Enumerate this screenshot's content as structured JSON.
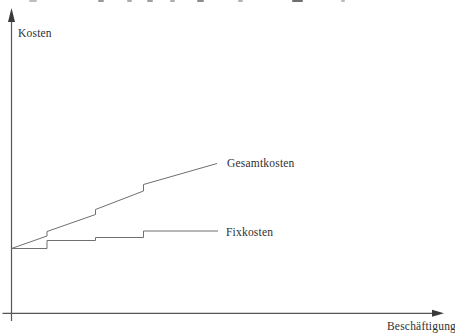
{
  "figure": {
    "y_axis_label": "Kosten",
    "x_axis_label": "Beschäftigung",
    "series_labels": {
      "gesamtkosten": "Gesamtkosten",
      "fixkosten": "Fixkosten"
    },
    "colors": {
      "axis": "#565656",
      "curve": "#6f6f6f",
      "text": "#2f2f2f",
      "background": "#ffffff"
    }
  },
  "chart_data": {
    "type": "line",
    "title": "",
    "xlabel": "Beschäftigung",
    "ylabel": "Kosten",
    "axes_numeric": false,
    "grid": false,
    "legend_position": "inline-right-of-line-end",
    "step_jump_x_px": [
      47,
      95.5,
      143.5
    ],
    "series": [
      {
        "name": "Gesamtkosten",
        "shape": "rising-stepped-curve",
        "points": [
          [
            11.5,
            248.5
          ],
          [
            47,
            236
          ],
          [
            47,
            231.5
          ],
          [
            95.5,
            214.5
          ],
          [
            95.5,
            209.5
          ],
          [
            143.5,
            191
          ],
          [
            143.5,
            184.5
          ],
          [
            217,
            163.5
          ]
        ]
      },
      {
        "name": "Fixkosten",
        "shape": "step-function",
        "points": [
          [
            11.5,
            248.5
          ],
          [
            47,
            248.5
          ],
          [
            47,
            240.5
          ],
          [
            95.5,
            240.5
          ],
          [
            95.5,
            237.5
          ],
          [
            143.5,
            237.5
          ],
          [
            143.5,
            231
          ],
          [
            218,
            231
          ]
        ]
      }
    ]
  },
  "artifacts": {
    "cropped_text_fragments": [
      {
        "x": 29,
        "w": 8,
        "c": "#bdbdbd"
      },
      {
        "x": 98,
        "w": 6,
        "c": "#9a9a9a"
      },
      {
        "x": 127,
        "w": 5,
        "c": "#ababab"
      },
      {
        "x": 147,
        "w": 6,
        "c": "#9f9f9f"
      },
      {
        "x": 170,
        "w": 5,
        "c": "#aeaeae"
      },
      {
        "x": 197,
        "w": 7,
        "c": "#8b8b8b"
      },
      {
        "x": 238,
        "w": 5,
        "c": "#b3b3b3"
      },
      {
        "x": 292,
        "w": 11,
        "c": "#6f6f6f"
      },
      {
        "x": 341,
        "w": 4,
        "c": "#bababa"
      }
    ]
  }
}
